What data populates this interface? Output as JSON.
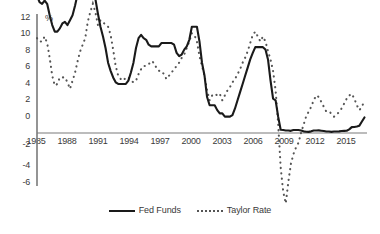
{
  "chart_data": {
    "type": "line",
    "title": "",
    "subtitle": "",
    "xlabel": "",
    "ylabel": "%",
    "unit_label": "%",
    "xlim": [
      1985,
      2017.5
    ],
    "ylim": [
      -6,
      12
    ],
    "ytick_step": 2,
    "grid": false,
    "legend_position": "bottom-center",
    "yticks": [
      12,
      10,
      8,
      6,
      4,
      2,
      0,
      -2,
      -4,
      -6
    ],
    "ytick_labels": [
      "12",
      "10",
      "8",
      "6",
      "4",
      "2",
      "0",
      "-2",
      "-4",
      "-6"
    ],
    "xticks": [
      1985,
      1988,
      1991,
      1994,
      1997,
      2000,
      2003,
      2006,
      2009,
      2012,
      2015
    ],
    "xtick_labels": [
      "1985",
      "1988",
      "1991",
      "1994",
      "1997",
      "2000",
      "2003",
      "2006",
      "2009",
      "2012",
      "2015"
    ],
    "x": [
      1985.0,
      1985.25,
      1985.5,
      1985.75,
      1986.0,
      1986.25,
      1986.5,
      1986.75,
      1987.0,
      1987.25,
      1987.5,
      1987.75,
      1988.0,
      1988.25,
      1988.5,
      1988.75,
      1989.0,
      1989.25,
      1989.5,
      1989.75,
      1990.0,
      1990.25,
      1990.5,
      1990.75,
      1991.0,
      1991.25,
      1991.5,
      1991.75,
      1992.0,
      1992.25,
      1992.5,
      1992.75,
      1993.0,
      1993.25,
      1993.5,
      1993.75,
      1994.0,
      1994.25,
      1994.5,
      1994.75,
      1995.0,
      1995.25,
      1995.5,
      1995.75,
      1996.0,
      1996.25,
      1996.5,
      1996.75,
      1997.0,
      1997.25,
      1997.5,
      1997.75,
      1998.0,
      1998.25,
      1998.5,
      1998.75,
      1999.0,
      1999.25,
      1999.5,
      1999.75,
      2000.0,
      2000.25,
      2000.5,
      2000.75,
      2001.0,
      2001.25,
      2001.5,
      2001.75,
      2002.0,
      2002.25,
      2002.5,
      2002.75,
      2003.0,
      2003.25,
      2003.5,
      2003.75,
      2004.0,
      2004.25,
      2004.5,
      2004.75,
      2005.0,
      2005.25,
      2005.5,
      2005.75,
      2006.0,
      2006.25,
      2006.5,
      2006.75,
      2007.0,
      2007.25,
      2007.5,
      2007.75,
      2008.0,
      2008.25,
      2008.5,
      2008.75,
      2009.0,
      2009.25,
      2009.5,
      2009.75,
      2010.0,
      2010.25,
      2010.5,
      2010.75,
      2011.0,
      2011.25,
      2011.5,
      2011.75,
      2012.0,
      2012.25,
      2012.5,
      2012.75,
      2013.0,
      2013.25,
      2013.5,
      2013.75,
      2014.0,
      2014.25,
      2014.5,
      2014.75,
      2015.0,
      2015.25,
      2015.5,
      2015.75,
      2016.0,
      2016.25,
      2016.5,
      2016.75,
      2017.0,
      2017.25
    ],
    "series": [
      {
        "name": "Fed Funds",
        "style": "solid",
        "color": "#1a1a1a",
        "values": [
          8.4,
          8.0,
          7.9,
          8.1,
          7.9,
          7.2,
          6.6,
          6.2,
          6.2,
          6.4,
          6.7,
          6.8,
          6.6,
          6.9,
          7.2,
          7.8,
          8.5,
          9.4,
          9.8,
          9.1,
          8.6,
          8.6,
          8.5,
          8.2,
          7.3,
          6.5,
          5.9,
          5.2,
          4.3,
          3.8,
          3.4,
          3.1,
          3.0,
          3.0,
          3.0,
          3.0,
          3.2,
          3.7,
          4.3,
          5.2,
          5.8,
          6.0,
          5.8,
          5.7,
          5.4,
          5.3,
          5.3,
          5.3,
          5.3,
          5.5,
          5.5,
          5.5,
          5.5,
          5.5,
          5.4,
          4.9,
          4.7,
          4.8,
          5.1,
          5.3,
          5.7,
          6.5,
          6.5,
          6.5,
          5.6,
          4.3,
          3.5,
          2.2,
          1.7,
          1.7,
          1.7,
          1.4,
          1.2,
          1.2,
          1.0,
          1.0,
          1.0,
          1.1,
          1.5,
          2.0,
          2.5,
          3.0,
          3.5,
          4.0,
          4.5,
          4.9,
          5.25,
          5.25,
          5.25,
          5.25,
          5.1,
          4.5,
          3.2,
          2.1,
          2.0,
          1.0,
          0.2,
          0.18,
          0.15,
          0.15,
          0.13,
          0.18,
          0.18,
          0.18,
          0.15,
          0.1,
          0.08,
          0.07,
          0.1,
          0.15,
          0.15,
          0.16,
          0.14,
          0.12,
          0.09,
          0.09,
          0.07,
          0.09,
          0.09,
          0.1,
          0.12,
          0.13,
          0.14,
          0.22,
          0.36,
          0.37,
          0.4,
          0.45,
          0.7,
          0.95
        ]
      },
      {
        "name": "Taylor Rate",
        "style": "dotted",
        "color": "#555555",
        "values": [
          5.8,
          5.6,
          5.6,
          5.9,
          5.5,
          4.6,
          3.5,
          2.9,
          3.0,
          3.4,
          3.4,
          3.4,
          3.1,
          2.7,
          3.2,
          3.7,
          4.4,
          5.0,
          5.4,
          5.8,
          6.8,
          7.4,
          7.9,
          7.4,
          6.6,
          6.9,
          6.8,
          6.6,
          6.5,
          6.0,
          5.1,
          4.1,
          3.5,
          3.3,
          3.2,
          3.4,
          3.4,
          3.2,
          3.1,
          3.2,
          3.6,
          3.9,
          4.1,
          4.1,
          4.2,
          4.4,
          4.3,
          4.0,
          3.8,
          3.8,
          3.6,
          3.3,
          3.5,
          3.7,
          3.9,
          4.1,
          4.3,
          4.6,
          4.8,
          5.2,
          5.6,
          6.1,
          6.0,
          5.6,
          4.7,
          4.1,
          3.5,
          2.6,
          2.0,
          2.3,
          2.4,
          2.3,
          2.4,
          2.0,
          2.3,
          2.6,
          2.8,
          3.1,
          3.3,
          3.6,
          3.9,
          4.3,
          4.6,
          5.0,
          5.5,
          6.0,
          6.2,
          5.9,
          5.6,
          5.9,
          5.6,
          5.0,
          4.5,
          3.8,
          2.6,
          0.6,
          -2.1,
          -3.6,
          -4.3,
          -3.0,
          -1.9,
          -1.3,
          -0.9,
          -0.6,
          0.0,
          0.5,
          1.0,
          1.3,
          1.6,
          2.0,
          2.3,
          2.2,
          1.9,
          1.6,
          1.3,
          1.3,
          1.2,
          1.0,
          1.1,
          1.3,
          1.5,
          1.8,
          2.1,
          2.3,
          2.4,
          2.1,
          1.7,
          1.4,
          1.6,
          2.0
        ]
      }
    ],
    "legend": [
      {
        "label": "Fed Funds",
        "style": "solid"
      },
      {
        "label": "Taylor Rate",
        "style": "dotted"
      }
    ]
  }
}
